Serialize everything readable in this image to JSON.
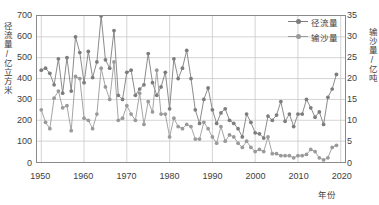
{
  "chart_data": {
    "type": "line",
    "title": "",
    "xlabel": "年份",
    "ylabel": "径流量/亿立方米",
    "ylabel_right": "输沙量/亿吨",
    "xlim": [
      1949,
      2021
    ],
    "ylim": [
      0,
      700
    ],
    "ylim_right": [
      0,
      35
    ],
    "grid": true,
    "legend_position": "top-right",
    "xticks": [
      1950,
      1960,
      1970,
      1980,
      1990,
      2000,
      2010,
      2020
    ],
    "yticks_left": [
      0,
      100,
      200,
      300,
      400,
      500,
      600,
      700
    ],
    "yticks_right": [
      0,
      5,
      10,
      15,
      20,
      25,
      30,
      35
    ],
    "x": [
      1950,
      1951,
      1952,
      1953,
      1954,
      1955,
      1956,
      1957,
      1958,
      1959,
      1960,
      1961,
      1962,
      1963,
      1964,
      1965,
      1966,
      1967,
      1968,
      1969,
      1970,
      1971,
      1972,
      1973,
      1974,
      1975,
      1976,
      1977,
      1978,
      1979,
      1980,
      1981,
      1982,
      1983,
      1984,
      1985,
      1986,
      1987,
      1988,
      1989,
      1990,
      1991,
      1992,
      1993,
      1994,
      1995,
      1996,
      1997,
      1998,
      1999,
      2000,
      2001,
      2002,
      2003,
      2004,
      2005,
      2006,
      2007,
      2008,
      2009,
      2010,
      2011,
      2012,
      2013,
      2014,
      2015,
      2016,
      2017,
      2018,
      2019
    ],
    "series": [
      {
        "name": "径流量",
        "axis": "left",
        "unit": "亿立方米",
        "color": "#7d7d7d",
        "values": [
          440,
          450,
          425,
          370,
          495,
          330,
          500,
          340,
          600,
          525,
          380,
          530,
          405,
          480,
          700,
          490,
          450,
          630,
          320,
          300,
          430,
          440,
          320,
          350,
          370,
          520,
          380,
          320,
          360,
          430,
          255,
          495,
          400,
          450,
          535,
          400,
          250,
          185,
          300,
          355,
          250,
          185,
          235,
          255,
          200,
          185,
          160,
          120,
          230,
          190,
          140,
          135,
          115,
          220,
          200,
          225,
          290,
          195,
          230,
          170,
          230,
          230,
          300,
          260,
          215,
          240,
          180,
          310,
          350,
          420
        ]
      },
      {
        "name": "输沙量",
        "axis": "right",
        "unit": "亿吨",
        "color": "#9a9a9a",
        "values": [
          12.5,
          9.5,
          8.0,
          15.3,
          17.0,
          13.0,
          13.5,
          7.5,
          20.5,
          20.0,
          10.5,
          10.0,
          8.0,
          11.5,
          22.5,
          18.0,
          15.0,
          24.0,
          10.0,
          10.5,
          13.5,
          11.5,
          10.0,
          16.5,
          9.0,
          14.5,
          12.0,
          22.0,
          11.5,
          11.5,
          6.0,
          10.5,
          8.5,
          8.0,
          9.0,
          8.5,
          5.5,
          5.5,
          9.5,
          8.0,
          6.0,
          4.5,
          8.5,
          5.0,
          6.5,
          6.0,
          4.5,
          3.5,
          5.0,
          3.5,
          2.5,
          3.0,
          2.5,
          6.0,
          2.0,
          2.0,
          1.5,
          1.5,
          1.5,
          1.0,
          1.5,
          1.5,
          1.8,
          3.0,
          2.5,
          1.0,
          0.5,
          1.0,
          3.5,
          4.0
        ]
      }
    ]
  },
  "legend": {
    "items": [
      {
        "label": "径流量"
      },
      {
        "label": "输沙量"
      }
    ]
  }
}
